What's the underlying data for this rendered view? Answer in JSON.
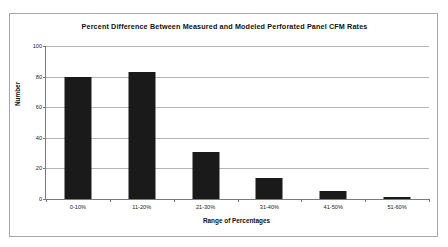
{
  "chart_data": {
    "type": "bar",
    "title": "Percent Difference Between Measured and Modeled Perforated Panel CFM Rates",
    "xlabel": "Range of Percentages",
    "ylabel": "Number",
    "categories": [
      "0-10%",
      "11-20%",
      "21-30%",
      "31-40%",
      "41-50%",
      "51-60%"
    ],
    "values": [
      80,
      83,
      31,
      14,
      5,
      1
    ],
    "ylim": [
      0,
      100
    ],
    "yticks": [
      0,
      20,
      40,
      60,
      80,
      100
    ],
    "ytick_labels": [
      "0",
      "20",
      "40",
      "60",
      "80",
      "100"
    ],
    "grid": "horizontal",
    "legend": "none",
    "bar_color": "#1a1a1a",
    "gridline_color": "#b5b5b5",
    "axis_color": "#7a7a7a",
    "frame_color": "#a8a8a8",
    "plot_background": "#ffffff"
  }
}
